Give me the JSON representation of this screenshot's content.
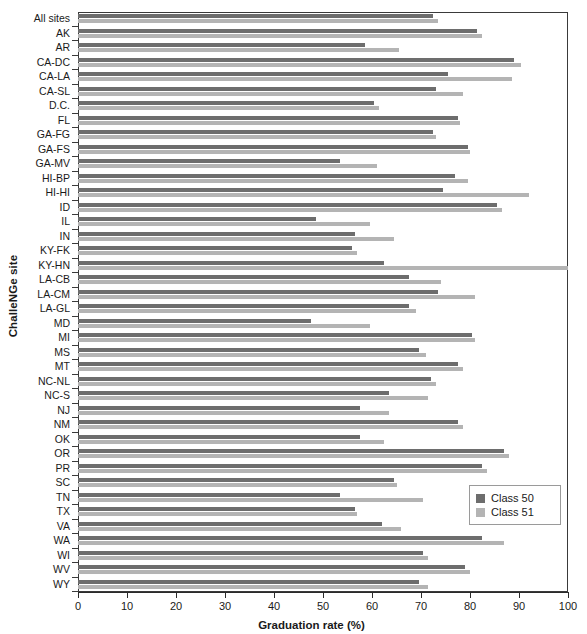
{
  "chart_data": {
    "type": "bar",
    "orientation": "horizontal",
    "title": "",
    "xlabel": "Graduation rate (%)",
    "ylabel": "ChalleNGe site",
    "xlim": [
      0,
      100
    ],
    "xticks": [
      0,
      10,
      20,
      30,
      40,
      50,
      60,
      70,
      80,
      90,
      100
    ],
    "grid": false,
    "legend_position": "right-lower",
    "colors": {
      "class50": "#6d6d6d",
      "class51": "#b4b4b4",
      "axis": "#2b2b2b",
      "frame": "#3a3a3a"
    },
    "categories": [
      "All sites",
      "AK",
      "AR",
      "CA-DC",
      "CA-LA",
      "CA-SL",
      "D.C.",
      "FL",
      "GA-FG",
      "GA-FS",
      "GA-MV",
      "HI-BP",
      "HI-HI",
      "ID",
      "IL",
      "IN",
      "KY-FK",
      "KY-HN",
      "LA-CB",
      "LA-CM",
      "LA-GL",
      "MD",
      "MI",
      "MS",
      "MT",
      "NC-NL",
      "NC-S",
      "NJ",
      "NM",
      "OK",
      "OR",
      "PR",
      "SC",
      "TN",
      "TX",
      "VA",
      "WA",
      "WI",
      "WV",
      "WY"
    ],
    "series": [
      {
        "name": "Class 50",
        "color": "#6d6d6d",
        "values": [
          72.5,
          81.5,
          58.5,
          89.0,
          75.5,
          73.0,
          60.5,
          77.5,
          72.5,
          79.5,
          53.5,
          77.0,
          74.5,
          85.5,
          48.5,
          56.5,
          56.0,
          62.5,
          67.5,
          73.5,
          67.5,
          47.5,
          80.5,
          69.5,
          77.5,
          72.0,
          63.5,
          57.5,
          77.5,
          57.5,
          87.0,
          82.5,
          64.5,
          53.5,
          56.5,
          62.0,
          82.5,
          70.5,
          79.0,
          69.5
        ]
      },
      {
        "name": "Class 51",
        "color": "#b4b4b4",
        "values": [
          73.5,
          82.5,
          65.5,
          90.5,
          88.5,
          78.5,
          61.5,
          78.0,
          73.0,
          80.0,
          61.0,
          79.5,
          92.0,
          86.5,
          59.5,
          64.5,
          57.0,
          100.0,
          74.0,
          81.0,
          69.0,
          59.5,
          81.0,
          71.0,
          78.5,
          73.0,
          71.5,
          63.5,
          78.5,
          62.5,
          88.0,
          83.5,
          65.0,
          70.5,
          57.0,
          66.0,
          87.0,
          71.5,
          80.0,
          71.5
        ]
      }
    ]
  },
  "legend": {
    "items": [
      {
        "label": "Class 50",
        "swatch": "class50"
      },
      {
        "label": "Class 51",
        "swatch": "class51"
      }
    ]
  }
}
